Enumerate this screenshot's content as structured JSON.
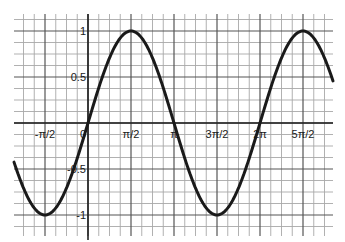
{
  "chart_data": {
    "type": "line",
    "title": "",
    "xlabel": "",
    "ylabel": "",
    "function": "y = sin(x)",
    "xlim_radians": [
      -2.7,
      8.95
    ],
    "ylim": [
      -1.15,
      1.15
    ],
    "grid": true,
    "grid_minor_x_step": "π/8",
    "grid_minor_y_step": 0.125,
    "x_tick_labels": [
      "-π/2",
      "0",
      "π/2",
      "π",
      "3π/2",
      "2π",
      "5π/2"
    ],
    "x_tick_values": [
      -1.5708,
      0,
      1.5708,
      3.1416,
      4.7124,
      6.2832,
      7.854
    ],
    "y_tick_labels": [
      "1",
      "0.5",
      "-0.5",
      "-1"
    ],
    "y_tick_values": [
      1,
      0.5,
      -0.5,
      -1
    ],
    "series": [
      {
        "name": "sin(x)",
        "color": "#1a1a1a",
        "points": [
          {
            "x": "-π/2",
            "y": -1
          },
          {
            "x": "0",
            "y": 0
          },
          {
            "x": "π/2",
            "y": 1
          },
          {
            "x": "π",
            "y": 0
          },
          {
            "x": "3π/2",
            "y": -1
          },
          {
            "x": "2π",
            "y": 0
          },
          {
            "x": "5π/2",
            "y": 1
          }
        ]
      }
    ],
    "legend": null
  },
  "layout": {
    "origin_px": [
      88,
      123
    ],
    "px_per_half_pi": 43,
    "px_per_unit_y": 92,
    "grid_left": 14,
    "grid_right": 333,
    "grid_top": 19,
    "grid_bottom": 236
  }
}
